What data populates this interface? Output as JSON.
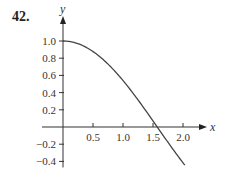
{
  "problem_number": "42.",
  "chart_data": {
    "type": "line",
    "title": "",
    "xlabel": "x",
    "ylabel": "y",
    "xlim": [
      0,
      2.2
    ],
    "ylim": [
      -0.45,
      1.1
    ],
    "x_ticks": [
      "0.5",
      "1.0",
      "1.5",
      "2.0"
    ],
    "y_ticks": [
      "1.0",
      "0.8",
      "0.6",
      "0.4",
      "0.2",
      "-0.2",
      "-0.4"
    ],
    "grid": false,
    "legend": null,
    "series": [
      {
        "name": "curve",
        "x": [
          0,
          0.25,
          0.5,
          0.75,
          1.0,
          1.25,
          1.5,
          1.57,
          1.75,
          2.0
        ],
        "y": [
          1.0,
          0.97,
          0.88,
          0.73,
          0.54,
          0.32,
          0.07,
          0.0,
          -0.18,
          -0.42
        ]
      }
    ]
  }
}
